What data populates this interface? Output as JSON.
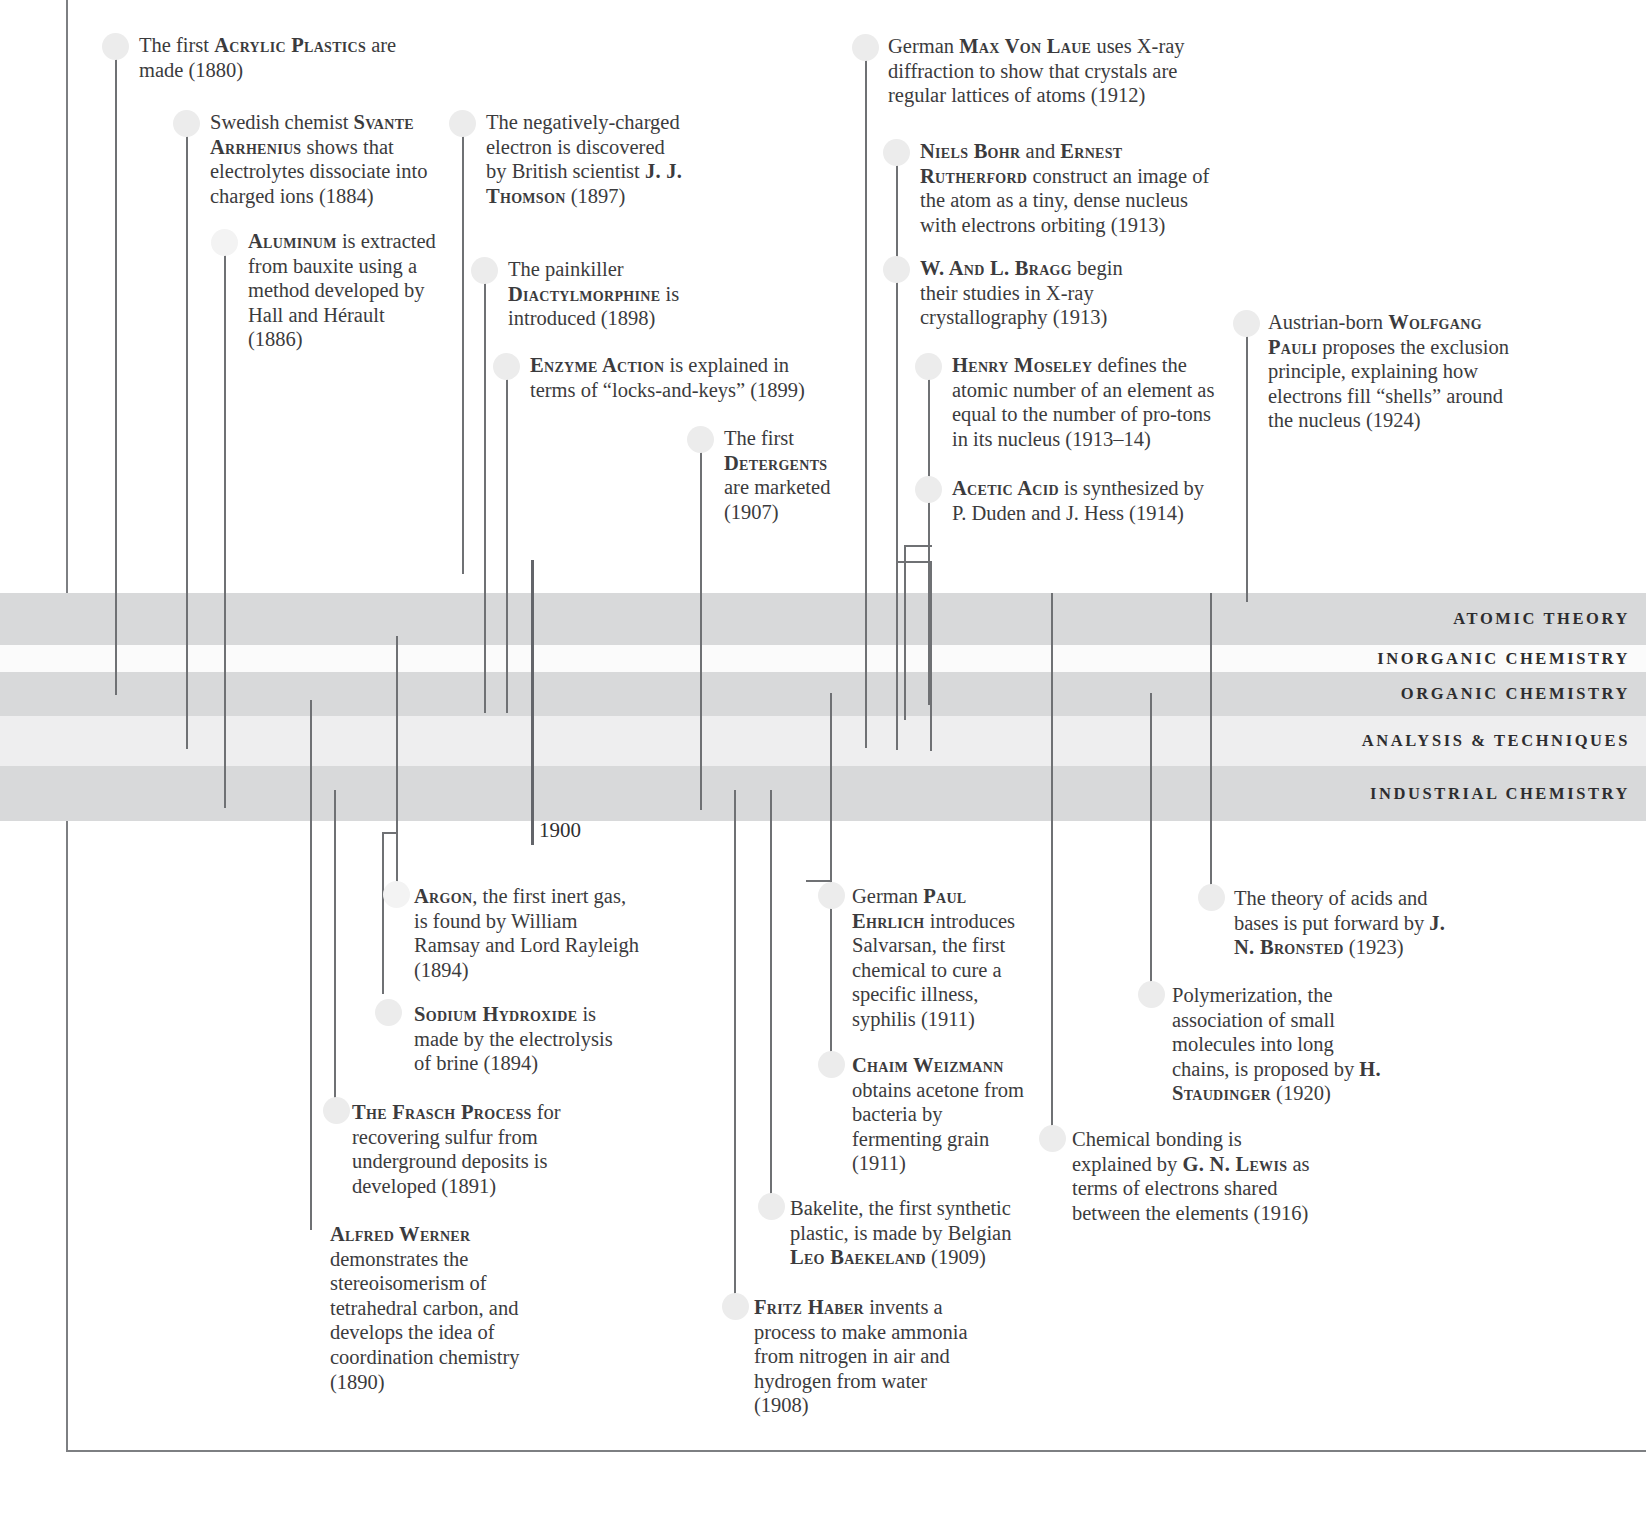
{
  "page": {
    "year_marker": "1900",
    "frame_color": "#7d7f82",
    "line_color": "#6f7174",
    "dot_color": "#ececec",
    "text_color": "#3b3b3d"
  },
  "bands": [
    {
      "label": "ATOMIC THEORY",
      "color": "#d8d9da",
      "top": 593,
      "height": 52
    },
    {
      "label": "INORGANIC CHEMISTRY",
      "color": "#fbfbfb",
      "top": 645,
      "height": 27
    },
    {
      "label": "ORGANIC CHEMISTRY",
      "color": "#d8d9da",
      "top": 672,
      "height": 44
    },
    {
      "label": "ANALYSIS & TECHNIQUES",
      "color": "#eeeeef",
      "top": 716,
      "height": 50
    },
    {
      "label": "INDUSTRIAL CHEMISTRY",
      "color": "#d8d9da",
      "top": 766,
      "height": 55
    }
  ],
  "entries": [
    {
      "id": "acrylic-plastics",
      "year": "1880",
      "parts": [
        {
          "t": "The first ",
          "s": "plain"
        },
        {
          "t": "ACRYLIC PLASTICS",
          "s": "name"
        },
        {
          "t": " are made (1880)",
          "s": "plain"
        }
      ]
    },
    {
      "id": "svante-arrhenius",
      "year": "1884",
      "parts": [
        {
          "t": "Swedish chemist ",
          "s": "plain"
        },
        {
          "t": "SVANTE ARRHENIUS",
          "s": "name"
        },
        {
          "t": " shows that electrolytes dissociate into charged ions (1884)",
          "s": "plain"
        }
      ]
    },
    {
      "id": "aluminum",
      "year": "1886",
      "parts": [
        {
          "t": "ALUMINUM",
          "s": "name"
        },
        {
          "t": " is extracted from bauxite using a method developed by Hall and Hérault (1886)",
          "s": "plain"
        }
      ]
    },
    {
      "id": "electron-thomson",
      "year": "1897",
      "parts": [
        {
          "t": "The negatively-charged electron is discovered by British scientist ",
          "s": "plain"
        },
        {
          "t": "J. J. THOMSON",
          "s": "name"
        },
        {
          "t": " (1897)",
          "s": "plain"
        }
      ]
    },
    {
      "id": "diactylmorphine",
      "year": "1898",
      "parts": [
        {
          "t": "The painkiller ",
          "s": "plain"
        },
        {
          "t": "DIACTYLMORPHINE",
          "s": "name"
        },
        {
          "t": " is introduced (1898)",
          "s": "plain"
        }
      ]
    },
    {
      "id": "enzyme-action",
      "year": "1899",
      "parts": [
        {
          "t": "ENZYME ACTION",
          "s": "name"
        },
        {
          "t": " is explained in terms of “locks-and-keys” (1899)",
          "s": "plain"
        }
      ]
    },
    {
      "id": "detergents",
      "year": "1907",
      "parts": [
        {
          "t": "The first ",
          "s": "plain"
        },
        {
          "t": "DETERGENTS",
          "s": "name"
        },
        {
          "t": " are marketed (1907)",
          "s": "plain"
        }
      ]
    },
    {
      "id": "max-von-laue",
      "year": "1912",
      "parts": [
        {
          "t": "German ",
          "s": "plain"
        },
        {
          "t": "MAX VON LAUE",
          "s": "name"
        },
        {
          "t": " uses X-ray diffraction to show that crystals are regular lattices of atoms (1912)",
          "s": "plain"
        }
      ]
    },
    {
      "id": "bohr-rutherford",
      "year": "1913",
      "parts": [
        {
          "t": "NIELS BOHR",
          "s": "name"
        },
        {
          "t": " and ",
          "s": "plain"
        },
        {
          "t": "ERNEST RUTHERFORD",
          "s": "name"
        },
        {
          "t": " construct an image of the atom as a tiny, dense nucleus with electrons orbiting (1913)",
          "s": "plain"
        }
      ]
    },
    {
      "id": "bragg",
      "year": "1913",
      "parts": [
        {
          "t": "W. AND L. BRAGG",
          "s": "name"
        },
        {
          "t": " begin their studies in X-ray crystallography (1913)",
          "s": "plain"
        }
      ]
    },
    {
      "id": "henry-moseley",
      "year": "1913-14",
      "parts": [
        {
          "t": "HENRY MOSELEY",
          "s": "name"
        },
        {
          "t": " defines the atomic number of an element as equal to the number of pro-tons in its nucleus (1913–14)",
          "s": "plain"
        }
      ]
    },
    {
      "id": "acetic-acid",
      "year": "1914",
      "parts": [
        {
          "t": "ACETIC ACID",
          "s": "name"
        },
        {
          "t": " is synthesized by P. Duden and J. Hess (1914)",
          "s": "plain"
        }
      ]
    },
    {
      "id": "wolfgang-pauli",
      "year": "1924",
      "parts": [
        {
          "t": "Austrian-born ",
          "s": "plain"
        },
        {
          "t": "WOLFGANG PAULI",
          "s": "name"
        },
        {
          "t": " proposes the exclusion principle, explaining how electrons fill “shells” around the nucleus (1924)",
          "s": "plain"
        }
      ]
    },
    {
      "id": "argon",
      "year": "1894",
      "parts": [
        {
          "t": "ARGON",
          "s": "name"
        },
        {
          "t": ", the first inert gas, is found by William Ramsay and Lord Rayleigh (1894)",
          "s": "plain"
        }
      ]
    },
    {
      "id": "sodium-hydroxide",
      "year": "1894",
      "parts": [
        {
          "t": "SODIUM HYDROXIDE",
          "s": "name"
        },
        {
          "t": " is made by the electrolysis of brine (1894)",
          "s": "plain"
        }
      ]
    },
    {
      "id": "frasch-process",
      "year": "1891",
      "parts": [
        {
          "t": "THE FRASCH PROCESS",
          "s": "name"
        },
        {
          "t": " for recovering sulfur from underground deposits is developed (1891)",
          "s": "plain"
        }
      ]
    },
    {
      "id": "alfred-werner",
      "year": "1890",
      "parts": [
        {
          "t": "ALFRED WERNER",
          "s": "name"
        },
        {
          "t": " demonstrates the stereoisomerism of tetrahedral carbon, and develops the idea of coordination chemistry (1890)",
          "s": "plain"
        }
      ]
    },
    {
      "id": "paul-ehrlich",
      "year": "1911",
      "parts": [
        {
          "t": "German ",
          "s": "plain"
        },
        {
          "t": "PAUL EHRLICH",
          "s": "name"
        },
        {
          "t": " introduces Salvarsan, the first chemical to cure a specific illness, syphilis (1911)",
          "s": "plain"
        }
      ]
    },
    {
      "id": "chaim-weizmann",
      "year": "1911",
      "parts": [
        {
          "t": "CHAIM WEIZMANN",
          "s": "name"
        },
        {
          "t": " obtains acetone from bacteria by fermenting grain (1911)",
          "s": "plain"
        }
      ]
    },
    {
      "id": "bakelite",
      "year": "1909",
      "parts": [
        {
          "t": "Bakelite, the first synthetic plastic, is made by Belgian ",
          "s": "plain"
        },
        {
          "t": "LEO BAEKELAND",
          "s": "name"
        },
        {
          "t": " (1909)",
          "s": "plain"
        }
      ]
    },
    {
      "id": "fritz-haber",
      "year": "1908",
      "parts": [
        {
          "t": "FRITZ HABER",
          "s": "name"
        },
        {
          "t": " invents a process to make ammonia from nitrogen in air and hydrogen from water (1908)",
          "s": "plain"
        }
      ]
    },
    {
      "id": "bronsted",
      "year": "1923",
      "parts": [
        {
          "t": "The theory of acids and bases is put forward by ",
          "s": "plain"
        },
        {
          "t": "J. N. BRONSTED",
          "s": "name"
        },
        {
          "t": " (1923)",
          "s": "plain"
        }
      ]
    },
    {
      "id": "staudinger",
      "year": "1920",
      "parts": [
        {
          "t": "Polymerization, the association of small molecules into long chains, is proposed by ",
          "s": "plain"
        },
        {
          "t": "H. STAUDINGER",
          "s": "name"
        },
        {
          "t": " (1920)",
          "s": "plain"
        }
      ]
    },
    {
      "id": "gn-lewis",
      "year": "1916",
      "parts": [
        {
          "t": "Chemical bonding is explained by ",
          "s": "plain"
        },
        {
          "t": "G. N. LEWIS",
          "s": "name"
        },
        {
          "t": " as terms of electrons shared between the elements (1916)",
          "s": "plain"
        }
      ]
    }
  ]
}
